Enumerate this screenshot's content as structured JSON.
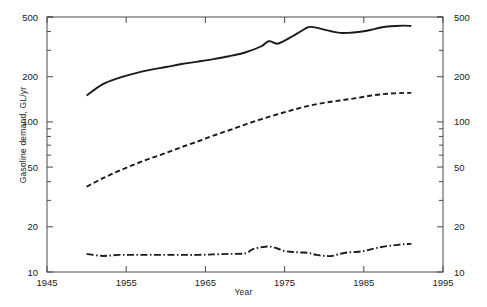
{
  "chart_data": {
    "type": "line",
    "title": "",
    "xlabel": "Year",
    "ylabel": "Gasoline demand, GL/yr",
    "ylabel_right": "Travel, km/yr Passenger cars × 10⁶",
    "yscale": "log",
    "xscale": "linear",
    "xlim": [
      1945,
      1995
    ],
    "ylim": [
      10,
      500
    ],
    "ylim_right": [
      10,
      500
    ],
    "grid": false,
    "legend": "none",
    "xticks": [
      1945,
      1955,
      1965,
      1975,
      1985,
      1995
    ],
    "xticklabels": [
      "1945",
      "1955",
      "1965",
      "1975",
      "1985",
      "1995"
    ],
    "yticks": [
      10,
      20,
      50,
      100,
      200,
      500
    ],
    "yticklabels": [
      "10",
      "20",
      "50",
      "100",
      "200",
      "500"
    ],
    "yticks_right": [
      10,
      20,
      50,
      100,
      200,
      500
    ],
    "yticklabels_right": [
      "10",
      "20",
      "50",
      "100",
      "200",
      "500"
    ],
    "series": [
      {
        "name": "Gasoline demand",
        "axis": "left",
        "linestyle": "solid",
        "color": "#1a1a1a",
        "x": [
          1950,
          1952,
          1954,
          1956,
          1958,
          1960,
          1962,
          1964,
          1966,
          1968,
          1970,
          1972,
          1973,
          1974,
          1975,
          1976,
          1977,
          1978,
          1979,
          1980,
          1981,
          1982,
          1983,
          1984,
          1985,
          1986,
          1987,
          1988,
          1989,
          1990,
          1991
        ],
        "y": [
          150,
          178,
          196,
          210,
          222,
          232,
          243,
          252,
          262,
          274,
          290,
          318,
          345,
          332,
          348,
          372,
          400,
          428,
          425,
          412,
          400,
          392,
          392,
          396,
          402,
          412,
          424,
          432,
          436,
          438,
          436
        ]
      },
      {
        "name": "Travel",
        "axis": "right",
        "linestyle": "dashed",
        "color": "#1a1a1a",
        "x": [
          1950,
          1952,
          1954,
          1956,
          1958,
          1960,
          1962,
          1964,
          1966,
          1968,
          1970,
          1972,
          1974,
          1976,
          1978,
          1980,
          1982,
          1984,
          1986,
          1988,
          1990,
          1991
        ],
        "y": [
          37,
          42,
          47,
          52,
          57,
          62,
          68,
          74,
          81,
          88,
          96,
          104,
          112,
          120,
          128,
          134,
          139,
          144,
          150,
          154,
          156,
          156
        ]
      },
      {
        "name": "Passenger cars",
        "axis": "right",
        "linestyle": "dashdot",
        "color": "#1a1a1a",
        "x": [
          1950,
          1952,
          1954,
          1956,
          1958,
          1960,
          1962,
          1964,
          1966,
          1968,
          1970,
          1971,
          1972,
          1973,
          1974,
          1975,
          1976,
          1977,
          1978,
          1979,
          1980,
          1981,
          1982,
          1983,
          1984,
          1985,
          1986,
          1987,
          1988,
          1989,
          1990,
          1991
        ],
        "y": [
          13.2,
          12.8,
          13.0,
          13.0,
          13.0,
          13.0,
          13.0,
          13.0,
          13.1,
          13.2,
          13.3,
          14.2,
          14.6,
          14.8,
          14.4,
          13.8,
          13.6,
          13.5,
          13.4,
          13.0,
          12.8,
          12.8,
          13.2,
          13.5,
          13.6,
          13.8,
          14.2,
          14.6,
          14.9,
          15.1,
          15.3,
          15.4
        ]
      }
    ]
  },
  "axis": {
    "xlabel": "Year",
    "ylabel_left": "Gasoline demand, GL/yr",
    "ylabel_right_main": "Travel, km/yr Passenger cars × 10",
    "ylabel_right_exp": "6"
  }
}
